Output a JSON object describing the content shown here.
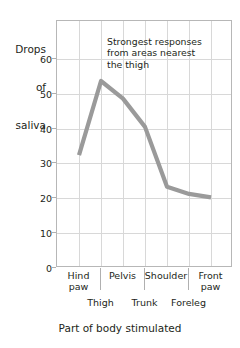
{
  "chart_data": {
    "type": "line",
    "title": "",
    "xlabel": "Part of body stimulated",
    "ylabel": "Drops of saliva",
    "ylabel_lines": [
      "Drops",
      "of",
      "saliva"
    ],
    "categories": [
      "Hind paw",
      "Thigh",
      "Pelvis",
      "Trunk",
      "Shoulder",
      "Foreleg",
      "Front paw"
    ],
    "values": [
      32,
      53,
      48,
      40,
      23,
      21,
      20
    ],
    "series": [
      {
        "name": "Drops of saliva",
        "values": [
          32,
          53,
          48,
          40,
          23,
          21,
          20
        ]
      }
    ],
    "ylim": [
      0,
      70
    ],
    "yticks": [
      0,
      10,
      20,
      30,
      40,
      50,
      60
    ],
    "ytick_labels": [
      "0",
      "10",
      "20",
      "30",
      "40",
      "50",
      "60"
    ],
    "grid": true,
    "legend": "none",
    "line_color": "#9a9a9a",
    "grid_color": "#d8d8d8",
    "frame_color": "#b7b7b7",
    "annotations": [
      {
        "name": "strongest-response-note",
        "lines": [
          "Strongest responses",
          "from areas nearest",
          "the thigh"
        ]
      }
    ],
    "xtick_rows": {
      "upper": [
        "Hind paw",
        "Pelvis",
        "Shoulder",
        "Front paw"
      ],
      "upper_wrapped": [
        [
          "Hind",
          "paw"
        ],
        [
          "Pelvis"
        ],
        [
          "Shoulder"
        ],
        [
          "Front",
          "paw"
        ]
      ],
      "lower": [
        "Thigh",
        "Trunk",
        "Foreleg"
      ]
    }
  }
}
